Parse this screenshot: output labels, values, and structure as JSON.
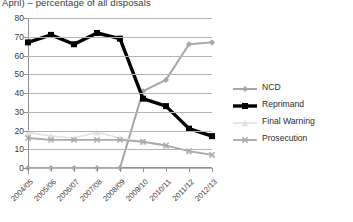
{
  "chart_data": {
    "type": "line",
    "title": "April) – percentage of all disposals",
    "xlabel": "",
    "ylabel": "",
    "ylim": [
      0,
      80
    ],
    "ytick_step": 10,
    "grid": true,
    "legend_position": "right",
    "categories": [
      "2004/05",
      "2005/06",
      "2006/07",
      "2007/08",
      "2008/09",
      "2009/10",
      "2010/11",
      "2011/12",
      "2012/13"
    ],
    "yticks": [
      "80",
      "70",
      "60",
      "50",
      "40",
      "30",
      "20",
      "10",
      "0"
    ],
    "series": [
      {
        "name": "NCD",
        "color": "#a6a6a6",
        "marker": "diamond",
        "width": 2,
        "values": [
          0,
          0,
          0,
          0,
          0,
          41,
          47,
          66,
          67
        ]
      },
      {
        "name": "Reprimand",
        "color": "#000000",
        "marker": "square",
        "width": 3.4,
        "values": [
          67,
          71,
          66,
          72,
          69,
          37,
          33,
          21,
          17
        ]
      },
      {
        "name": "Final Warning",
        "color": "#e2e2e2",
        "marker": "triangle",
        "width": 1.6,
        "values": [
          19,
          17,
          16,
          19,
          16,
          14,
          12,
          9,
          7
        ]
      },
      {
        "name": "Prosecution",
        "color": "#a9a9a9",
        "marker": "cross",
        "width": 1.8,
        "values": [
          16,
          15,
          15,
          15,
          15,
          14,
          12,
          9,
          7
        ]
      }
    ]
  },
  "legend": {
    "items": [
      {
        "label": "NCD"
      },
      {
        "label": "Reprimand"
      },
      {
        "label": "Final Warning"
      },
      {
        "label": "Prosecution"
      }
    ]
  }
}
